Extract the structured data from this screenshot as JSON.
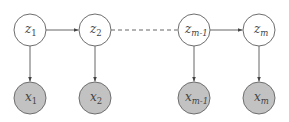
{
  "diagram": {
    "type": "graphical-model-chain",
    "colors": {
      "latent_fill": "#ffffff",
      "observed_fill": "#c2c2c2",
      "stroke": "#6e6e6e",
      "edge": "#555555",
      "text": "#444444"
    },
    "latent_nodes": [
      {
        "id": "z1",
        "var": "z",
        "sub": "1",
        "cx": 30,
        "cy": 30
      },
      {
        "id": "z2",
        "var": "z",
        "sub": "2",
        "cx": 95,
        "cy": 30
      },
      {
        "id": "zm1",
        "var": "z",
        "sub": "m-1",
        "cx": 194,
        "cy": 30
      },
      {
        "id": "zm",
        "var": "z",
        "sub": "m",
        "cx": 259,
        "cy": 30
      }
    ],
    "observed_nodes": [
      {
        "id": "x1",
        "var": "x",
        "sub": "1",
        "cx": 30,
        "cy": 98
      },
      {
        "id": "x2",
        "var": "x",
        "sub": "2",
        "cx": 95,
        "cy": 98
      },
      {
        "id": "xm1",
        "var": "x",
        "sub": "m-1",
        "cx": 194,
        "cy": 98
      },
      {
        "id": "xm",
        "var": "x",
        "sub": "m",
        "cx": 259,
        "cy": 98
      }
    ],
    "edges": [
      {
        "from": "z1",
        "to": "z2",
        "style": "solid-arrow"
      },
      {
        "from": "z2",
        "to": "zm1",
        "style": "dashed"
      },
      {
        "from": "zm1",
        "to": "zm",
        "style": "solid-arrow"
      },
      {
        "from": "z1",
        "to": "x1",
        "style": "solid-arrow"
      },
      {
        "from": "z2",
        "to": "x2",
        "style": "solid-arrow"
      },
      {
        "from": "zm1",
        "to": "xm1",
        "style": "solid-arrow"
      },
      {
        "from": "zm",
        "to": "xm",
        "style": "solid-arrow"
      }
    ],
    "node_radius": 16
  }
}
